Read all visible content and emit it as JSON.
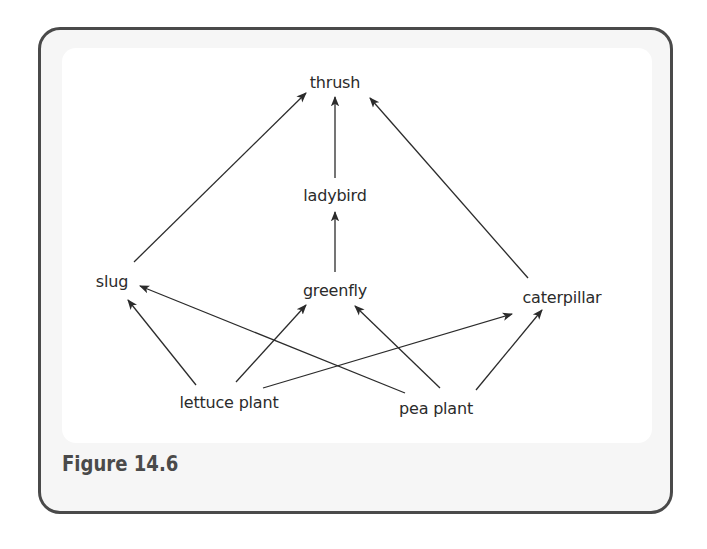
{
  "figure": {
    "caption": "Figure 14.6",
    "type": "food-web"
  },
  "nodes": {
    "thrush": {
      "label": "thrush"
    },
    "ladybird": {
      "label": "ladybird"
    },
    "greenfly": {
      "label": "greenfly"
    },
    "slug": {
      "label": "slug"
    },
    "caterpillar": {
      "label": "caterpillar"
    },
    "lettuce_plant": {
      "label": "lettuce plant"
    },
    "pea_plant": {
      "label": "pea plant"
    }
  },
  "edges": [
    {
      "from": "slug",
      "to": "thrush"
    },
    {
      "from": "ladybird",
      "to": "thrush"
    },
    {
      "from": "caterpillar",
      "to": "thrush"
    },
    {
      "from": "greenfly",
      "to": "ladybird"
    },
    {
      "from": "lettuce_plant",
      "to": "slug"
    },
    {
      "from": "lettuce_plant",
      "to": "greenfly"
    },
    {
      "from": "lettuce_plant",
      "to": "caterpillar"
    },
    {
      "from": "pea_plant",
      "to": "slug"
    },
    {
      "from": "pea_plant",
      "to": "greenfly"
    },
    {
      "from": "pea_plant",
      "to": "caterpillar"
    }
  ],
  "colors": {
    "border": "#4a4a4a",
    "text": "#2b2b2b",
    "arrow": "#2b2b2b",
    "caption": "#4a4a4a"
  }
}
